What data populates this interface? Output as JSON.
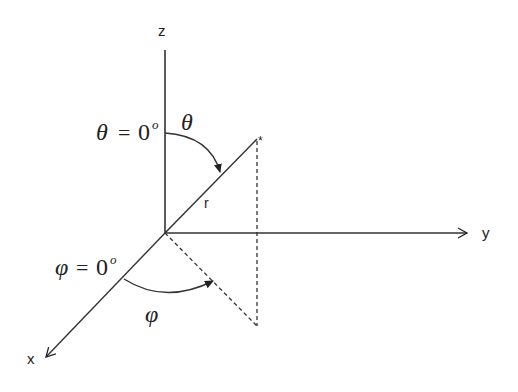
{
  "diagram": {
    "axes": {
      "z": {
        "label": "z"
      },
      "y": {
        "label": "y"
      },
      "x": {
        "label": "x"
      }
    },
    "vector": {
      "label": "r",
      "tip_marker": "*"
    },
    "angles": {
      "theta": {
        "symbol": "θ",
        "reference_symbol": "θ",
        "equals": "=",
        "reference_value": "0",
        "degree": "o"
      },
      "phi": {
        "symbol": "φ",
        "reference_symbol": "φ",
        "equals": "=",
        "reference_value": "0",
        "degree": "o"
      }
    },
    "colors": {
      "line": "#333333",
      "background": "#ffffff"
    }
  }
}
